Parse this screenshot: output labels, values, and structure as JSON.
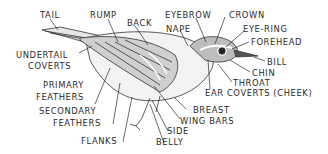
{
  "diagram": {
    "labels": {
      "tail": "TAIL",
      "rump": "RUMP",
      "back": "BACK",
      "eyebrow": "EYEBROW",
      "nape": "NAPE",
      "crown": "CROWN",
      "eye_ring": "EYE-RING",
      "forehead": "FOREHEAD",
      "bill": "BILL",
      "chin": "CHIN",
      "throat": "THROAT",
      "ear_coverts": "EAR COVERTS (CHEEK)",
      "undertail_coverts_1": "UNDERTAIL",
      "undertail_coverts_2": "COVERTS",
      "primary_feathers_1": "PRIMARY",
      "primary_feathers_2": "FEATHERS",
      "secondary_feathers_1": "SECONDARY",
      "secondary_feathers_2": "FEATHERS",
      "flanks": "FLANKS",
      "breast": "BREAST",
      "wing_bars": "WING BARS",
      "side": "SIDE",
      "belly": "BELLY"
    },
    "colors": {
      "ink": "#2b2b2b",
      "background": "#ffffff"
    }
  }
}
